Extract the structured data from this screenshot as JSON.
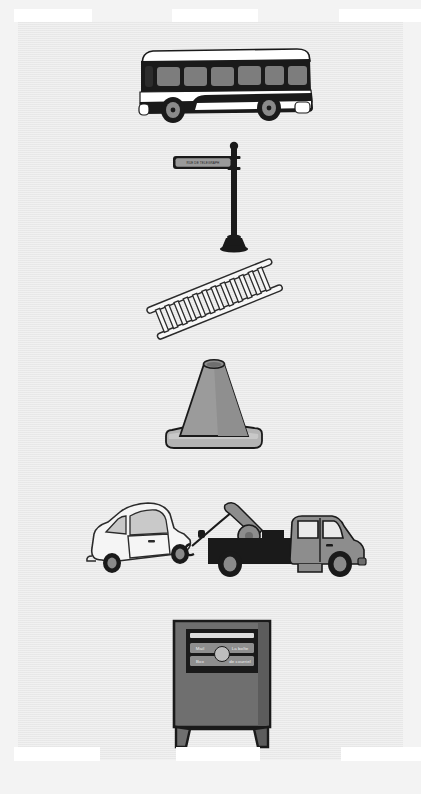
{
  "page": {
    "background_color": "#f3f3f3",
    "panel_color": "#ebebeb",
    "ink_color": "#1a1a1a",
    "mid_gray": "#8a8a8a",
    "light_gray": "#d0d0d0",
    "width": 421,
    "height": 794
  },
  "film_strip": {
    "name": "film-sprocket-holes",
    "hole_color": "#ffffff",
    "top_holes": [
      {
        "x": 14,
        "y": 9,
        "w": 78,
        "h": 13
      },
      {
        "x": 172,
        "y": 9,
        "w": 86,
        "h": 13
      },
      {
        "x": 339,
        "y": 9,
        "w": 82,
        "h": 13
      }
    ],
    "bottom_holes": [
      {
        "x": 14,
        "y": 747,
        "w": 86,
        "h": 14
      },
      {
        "x": 176,
        "y": 747,
        "w": 84,
        "h": 14
      },
      {
        "x": 341,
        "y": 747,
        "w": 80,
        "h": 14
      }
    ]
  },
  "figures": [
    {
      "id": "bus",
      "name": "city-bus",
      "caption": "City bus, side view",
      "window_count": 6,
      "wheel_count": 2,
      "body_color": "#1a1a1a",
      "window_color": "#7d7d7d",
      "trim_color": "#ffffff",
      "x": 135,
      "y": 46,
      "w": 180,
      "h": 80
    },
    {
      "id": "street-sign",
      "name": "street-name-sign-post",
      "caption": "Street name sign on a post",
      "sign_text": "RUE DE TELEGRAPH",
      "post_color": "#1a1a1a",
      "plate_color": "#909090",
      "x": 170,
      "y": 140,
      "w": 80,
      "h": 110
    },
    {
      "id": "ladder",
      "name": "extension-ladder",
      "caption": "Ladder leaning diagonally",
      "rung_count": 13,
      "rail_color": "#f7f7f7",
      "outline_color": "#2b2b2b",
      "x": 140,
      "y": 255,
      "w": 145,
      "h": 90
    },
    {
      "id": "traffic-cone",
      "name": "traffic-cone",
      "caption": "Traffic cone with square base",
      "cone_color": "#9b9b9b",
      "base_color": "#b4b4b4",
      "outline_color": "#1a1a1a",
      "x": 158,
      "y": 348,
      "w": 110,
      "h": 105
    },
    {
      "id": "tow-truck-scene",
      "name": "tow-truck-towing-car",
      "caption": "Tow truck hauling a small car",
      "truck_body_color": "#1a1a1a",
      "truck_cab_color": "#8d8d8d",
      "car_color": "#f5f5f5",
      "car_glass_color": "#c9c9c9",
      "x": 88,
      "y": 490,
      "w": 275,
      "h": 90
    },
    {
      "id": "mailbox",
      "name": "public-mailbox",
      "caption": "Street letter box / mail box",
      "box_color": "#6f6f6f",
      "panel_color": "#1a1a1a",
      "label_line_1_left": "Mail",
      "label_line_1_right": "La boîte",
      "label_line_2_left": "Box",
      "label_line_2_right": "de courriel",
      "x": 168,
      "y": 617,
      "w": 108,
      "h": 132
    }
  ]
}
